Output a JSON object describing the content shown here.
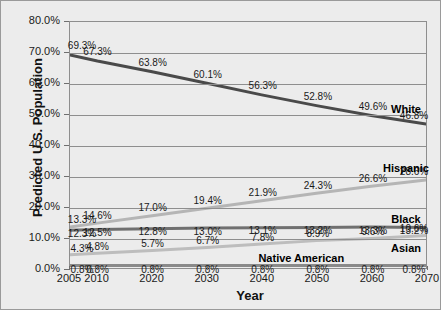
{
  "chart_data": {
    "type": "line",
    "title": "",
    "xlabel": "Year",
    "ylabel": "Predicted U.S. Population",
    "x": [
      2005,
      2010,
      2020,
      2030,
      2040,
      2050,
      2060,
      2070
    ],
    "categories": [
      "2005",
      "2010",
      "2020",
      "2030",
      "2040",
      "2050",
      "2060",
      "2070"
    ],
    "xtick_labels": [
      "2005",
      "2010",
      "2020",
      "2030",
      "2040",
      "2050",
      "2060",
      "2070"
    ],
    "ytick_labels": [
      "0.0%",
      "10.0%",
      "20.0%",
      "30.0%",
      "40.0%",
      "50.0%",
      "60.0%",
      "70.0%",
      "80.0%"
    ],
    "ytick_values": [
      0,
      10,
      20,
      30,
      40,
      50,
      60,
      70,
      80
    ],
    "ylim": [
      0,
      80
    ],
    "grid": "horizontal",
    "legend": "inline-right-labels",
    "series": [
      {
        "name": "White",
        "color": "#4a4a4a",
        "values": [
          69.3,
          67.3,
          63.8,
          60.1,
          56.3,
          52.8,
          49.6,
          46.8
        ],
        "value_labels": [
          "69.3%",
          "67.3%",
          "63.8%",
          "60.1%",
          "56.3%",
          "52.8%",
          "49.6%",
          "46.8%"
        ]
      },
      {
        "name": "Hispanic",
        "color": "#b5b5b5",
        "values": [
          13.3,
          14.6,
          17.0,
          19.4,
          21.9,
          24.3,
          26.6,
          28.6
        ],
        "value_labels": [
          "13.3%",
          "14.6%",
          "17.0%",
          "19.4%",
          "21.9%",
          "24.3%",
          "26.6%",
          "28.6%"
        ]
      },
      {
        "name": "Black",
        "color": "#707070",
        "values": [
          12.3,
          12.5,
          12.8,
          13.0,
          13.1,
          13.2,
          13.3,
          13.2
        ],
        "value_labels": [
          "12.3%",
          "12.5%",
          "12.8%",
          "13.0%",
          "13.1%",
          "13.2%",
          "13.3%",
          "13.2%"
        ]
      },
      {
        "name": "Asian",
        "color": "#bdbdbd",
        "values": [
          4.3,
          4.8,
          5.7,
          6.7,
          7.8,
          8.9,
          9.6,
          10.6
        ],
        "value_labels": [
          "4.3%",
          "4.8%",
          "5.7%",
          "6.7%",
          "7.8%",
          "8.9%",
          "9.6%",
          "10.6%"
        ]
      },
      {
        "name": "Native American",
        "color": "#8a8a8a",
        "values": [
          0.8,
          0.8,
          0.8,
          0.8,
          0.8,
          0.8,
          0.8,
          0.8
        ],
        "value_labels": [
          "0.8%",
          "0.8%",
          "0.8%",
          "0.8%",
          "0.8%",
          "0.8%",
          "0.8%",
          "0.8%"
        ]
      }
    ],
    "series_name_labels": [
      {
        "name": "White",
        "text": "White",
        "x": 2070,
        "y": 52.0
      },
      {
        "name": "Hispanic",
        "text": "Hispanic",
        "x": 2070,
        "y": 33.0
      },
      {
        "name": "Black",
        "text": "Black",
        "x": 2070,
        "y": 16.4
      },
      {
        "name": "Asian",
        "text": "Asian",
        "x": 2070,
        "y": 7.2
      },
      {
        "name": "Native American",
        "text": "Native American",
        "x": 2047,
        "y": 4.0
      }
    ]
  }
}
